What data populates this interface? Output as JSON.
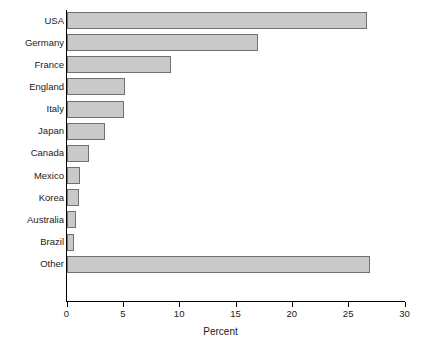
{
  "chart_data": {
    "type": "bar",
    "orientation": "horizontal",
    "title": "",
    "xlabel": "Percent",
    "ylabel": "",
    "xlim": [
      0,
      30
    ],
    "xticks": [
      0,
      5,
      10,
      15,
      20,
      25,
      30
    ],
    "xtick_labels": [
      "0",
      "5",
      "10",
      "15",
      "20",
      "25",
      "30"
    ],
    "grid": false,
    "legend": false,
    "bar_fill_color": "#c9c9c9",
    "bar_border_color": "#707070",
    "axis_color": "#000000",
    "background_color": "#ffffff",
    "categories": [
      "USA",
      "Germany",
      "France",
      "England",
      "Italy",
      "Japan",
      "Canada",
      "Mexico",
      "Korea",
      "Australia",
      "Brazil",
      "Other"
    ],
    "values": [
      26.7,
      17.0,
      9.3,
      5.2,
      5.1,
      3.4,
      2.0,
      1.2,
      1.1,
      0.8,
      0.7,
      26.9
    ],
    "series": [
      {
        "name": "Percent",
        "values": [
          26.7,
          17.0,
          9.3,
          5.2,
          5.1,
          3.4,
          2.0,
          1.2,
          1.1,
          0.8,
          0.7,
          26.9
        ]
      }
    ]
  }
}
